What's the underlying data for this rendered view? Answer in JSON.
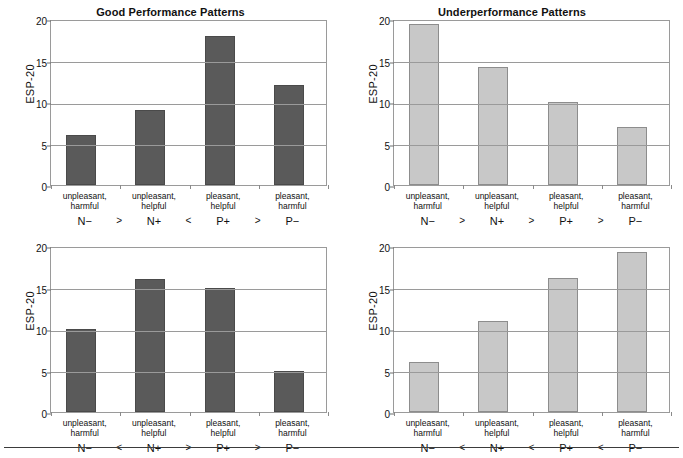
{
  "chart_data": [
    {
      "type": "bar",
      "panel_id": "top-left",
      "title": "Good Performance Patterns",
      "xlabel": "",
      "ylabel": "ESP-20",
      "ylim": [
        0,
        20
      ],
      "yticks": [
        0,
        5,
        10,
        15,
        20
      ],
      "grid": true,
      "legend": "none",
      "bar_color": "#5a5a5a",
      "categories": [
        "unpleasant,\nharmful",
        "unpleasant,\nhelpful",
        "pleasant,\nhelpful",
        "pleasant,\nharmful"
      ],
      "category_lines": [
        [
          "unpleasant,",
          "harmful"
        ],
        [
          "unpleasant,",
          "helpful"
        ],
        [
          "pleasant,",
          "helpful"
        ],
        [
          "pleasant,",
          "harmful"
        ]
      ],
      "codes": [
        "N−",
        "N+",
        "P+",
        "P−"
      ],
      "operators": [
        ">",
        "<",
        ">"
      ],
      "values": [
        6,
        9,
        18,
        12
      ]
    },
    {
      "type": "bar",
      "panel_id": "top-right",
      "title": "Underperformance Patterns",
      "xlabel": "",
      "ylabel": "ESP-20",
      "ylim": [
        0,
        20
      ],
      "yticks": [
        0,
        5,
        10,
        15,
        20
      ],
      "grid": true,
      "legend": "none",
      "bar_color": "#c8c8c8",
      "categories": [
        "unpleasant,\nharmful",
        "unpleasant,\nhelpful",
        "pleasant,\nhelpful",
        "pleasant,\nharmful"
      ],
      "category_lines": [
        [
          "unpleasant,",
          "harmful"
        ],
        [
          "unpleasant,",
          "helpful"
        ],
        [
          "pleasant,",
          "helpful"
        ],
        [
          "pleasant,",
          "harmful"
        ]
      ],
      "codes": [
        "N−",
        "N+",
        "P+",
        "P−"
      ],
      "operators": [
        ">",
        ">",
        ">"
      ],
      "values": [
        19.4,
        14.2,
        10,
        7
      ]
    },
    {
      "type": "bar",
      "panel_id": "bottom-left",
      "title": "",
      "xlabel": "",
      "ylabel": "ESP-20",
      "ylim": [
        0,
        20
      ],
      "yticks": [
        0,
        5,
        10,
        15,
        20
      ],
      "grid": true,
      "legend": "none",
      "bar_color": "#5a5a5a",
      "categories": [
        "unpleasant,\nharmful",
        "unpleasant,\nhelpful",
        "pleasant,\nhelpful",
        "pleasant,\nharmful"
      ],
      "category_lines": [
        [
          "unpleasant,",
          "harmful"
        ],
        [
          "unpleasant,",
          "helpful"
        ],
        [
          "pleasant,",
          "helpful"
        ],
        [
          "pleasant,",
          "harmful"
        ]
      ],
      "codes": [
        "N−",
        "N+",
        "P+",
        "P−"
      ],
      "operators": [
        "<",
        ">",
        ">"
      ],
      "values": [
        10,
        16,
        15,
        5
      ]
    },
    {
      "type": "bar",
      "panel_id": "bottom-right",
      "title": "",
      "xlabel": "",
      "ylabel": "ESP-20",
      "ylim": [
        0,
        20
      ],
      "yticks": [
        0,
        5,
        10,
        15,
        20
      ],
      "grid": true,
      "legend": "none",
      "bar_color": "#c8c8c8",
      "categories": [
        "unpleasant,\nharmful",
        "unpleasant,\nhelpful",
        "pleasant,\nhelpful",
        "pleasant,\nharmful"
      ],
      "category_lines": [
        [
          "unpleasant,",
          "harmful"
        ],
        [
          "unpleasant,",
          "helpful"
        ],
        [
          "pleasant,",
          "helpful"
        ],
        [
          "pleasant,",
          "harmful"
        ]
      ],
      "codes": [
        "N−",
        "N+",
        "P+",
        "P−"
      ],
      "operators": [
        "<",
        "<",
        "<"
      ],
      "values": [
        6,
        11,
        16.2,
        19.3
      ]
    }
  ],
  "colors": {
    "bar_dark": "#5a5a5a",
    "bar_light": "#c8c8c8",
    "axis": "#9a9a9a",
    "text": "#1a1a1a",
    "footer_rule": "#3b3b3b"
  }
}
